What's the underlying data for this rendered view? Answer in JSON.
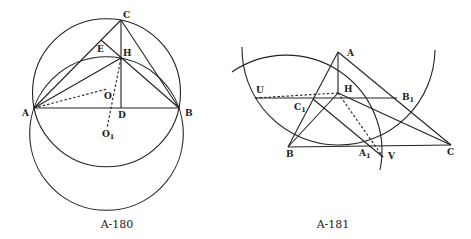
{
  "figures": [
    {
      "caption": "A-180",
      "points": {
        "A": "A",
        "B": "B",
        "C": "C",
        "D": "D",
        "E": "E",
        "H": "H",
        "O": "O",
        "O1_main": "O",
        "O1_sub": "1"
      }
    },
    {
      "caption": "A-181",
      "points": {
        "A": "A",
        "B": "B",
        "C": "C",
        "H": "H",
        "U": "U",
        "V": "V",
        "A1_main": "A",
        "A1_sub": "1",
        "B1_main": "B",
        "B1_sub": "1",
        "C1_main": "C",
        "C1_sub": "1"
      }
    }
  ],
  "colors": {
    "stroke": "#222222",
    "background": "#ffffff"
  }
}
